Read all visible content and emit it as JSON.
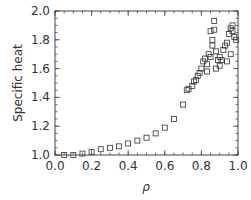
{
  "chart_data": {
    "type": "scatter",
    "title": "",
    "xlabel": "ρ",
    "ylabel": "Specific heat",
    "xlim": [
      0.0,
      1.0
    ],
    "ylim": [
      1.0,
      2.0
    ],
    "xticks": [
      "0.0",
      "0.2",
      "0.4",
      "0.6",
      "0.8",
      "1.0"
    ],
    "yticks": [
      "1.0",
      "1.2",
      "1.4",
      "1.6",
      "1.8",
      "2.0"
    ],
    "grid": false,
    "legend": null,
    "marker": "open-square",
    "series": [
      {
        "name": "specific heat",
        "points": [
          [
            0.05,
            1.0
          ],
          [
            0.1,
            1.0
          ],
          [
            0.15,
            1.01
          ],
          [
            0.2,
            1.02
          ],
          [
            0.25,
            1.04
          ],
          [
            0.3,
            1.05
          ],
          [
            0.35,
            1.06
          ],
          [
            0.4,
            1.08
          ],
          [
            0.45,
            1.1
          ],
          [
            0.5,
            1.12
          ],
          [
            0.55,
            1.15
          ],
          [
            0.6,
            1.19
          ],
          [
            0.65,
            1.25
          ],
          [
            0.7,
            1.35
          ],
          [
            0.72,
            1.45
          ],
          [
            0.73,
            1.46
          ],
          [
            0.75,
            1.48
          ],
          [
            0.76,
            1.51
          ],
          [
            0.77,
            1.52
          ],
          [
            0.78,
            1.55
          ],
          [
            0.79,
            1.57
          ],
          [
            0.8,
            1.6
          ],
          [
            0.81,
            1.65
          ],
          [
            0.82,
            1.67
          ],
          [
            0.83,
            1.63
          ],
          [
            0.84,
            1.7
          ],
          [
            0.85,
            1.86
          ],
          [
            0.86,
            1.8
          ],
          [
            0.87,
            1.93
          ],
          [
            0.86,
            1.76
          ],
          [
            0.87,
            1.87
          ],
          [
            0.88,
            1.6
          ],
          [
            0.89,
            1.66
          ],
          [
            0.9,
            1.68
          ],
          [
            0.91,
            1.66
          ],
          [
            0.92,
            1.73
          ],
          [
            0.93,
            1.76
          ],
          [
            0.94,
            1.78
          ],
          [
            0.95,
            1.84
          ],
          [
            0.96,
            1.88
          ],
          [
            0.97,
            1.9
          ],
          [
            0.98,
            1.82
          ],
          [
            0.99,
            1.8
          ],
          [
            0.96,
            1.7
          ],
          [
            0.85,
            1.68
          ],
          [
            0.83,
            1.58
          ],
          [
            0.88,
            1.72
          ],
          [
            0.9,
            1.62
          ],
          [
            0.94,
            1.65
          ],
          [
            0.97,
            1.86
          ]
        ]
      }
    ]
  }
}
